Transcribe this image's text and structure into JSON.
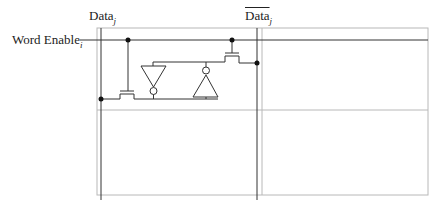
{
  "diagram": {
    "type": "sram-cell-circuit",
    "labels": {
      "data_line": "Data",
      "data_line_sub": "j",
      "data_bar_line": "Data",
      "data_bar_line_sub": "j",
      "word_enable": "Word Enable",
      "word_enable_sub": "i"
    },
    "components": [
      {
        "id": "pass-transistor-left",
        "kind": "nmos-pass-transistor"
      },
      {
        "id": "pass-transistor-right",
        "kind": "nmos-pass-transistor"
      },
      {
        "id": "inverter-left",
        "kind": "inverter",
        "orientation": "down"
      },
      {
        "id": "inverter-right",
        "kind": "inverter",
        "orientation": "up"
      }
    ],
    "colors": {
      "wire": "#222222",
      "cell_grid": "#b0b0b0"
    }
  }
}
